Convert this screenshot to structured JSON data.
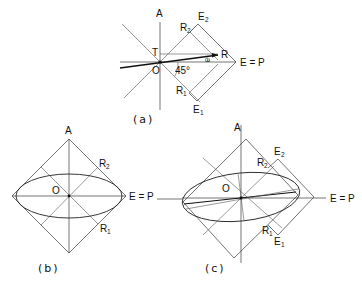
{
  "figure": {
    "panels": [
      {
        "id": "a",
        "caption": "(a)",
        "labels": {
          "A": "A",
          "T": "T",
          "O": "O",
          "R": "R",
          "R2": "R",
          "R2_sub": "2",
          "E2": "E",
          "E2_sub": "2",
          "R1": "R",
          "R1_sub": "1",
          "E1": "E",
          "E1_sub": "1",
          "EP": "E = P",
          "angle45": "45°",
          "omega": "ω"
        }
      },
      {
        "id": "b",
        "caption": "(b)",
        "labels": {
          "A": "A",
          "O": "O",
          "R2": "R",
          "R2_sub": "2",
          "R1": "R",
          "R1_sub": "1",
          "EP": "E = P"
        }
      },
      {
        "id": "c",
        "caption": "(c)",
        "labels": {
          "A": "A",
          "O": "O",
          "R2": "R",
          "R2_sub": "2",
          "E2": "E",
          "E2_sub": "2",
          "R1": "R",
          "R1_sub": "1",
          "E1": "E",
          "E1_sub": "1",
          "EP": "E = P"
        }
      }
    ]
  }
}
